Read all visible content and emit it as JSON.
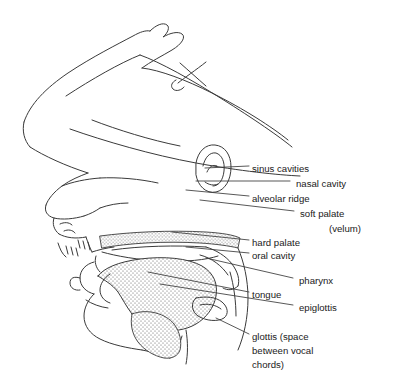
{
  "figure": {
    "kind": "anatomical-line-drawing",
    "background_color": "#ffffff",
    "ink_color": "#3a3a3a",
    "text_color": "#1a1a1a",
    "stipple_color": "#555555",
    "width": 396,
    "height": 386
  },
  "labels": [
    {
      "id": "sinus-cavities",
      "text": "sinus cavities",
      "x": 252,
      "y": 169
    },
    {
      "id": "nasal-cavity",
      "text": "nasal cavity",
      "x": 296,
      "y": 184
    },
    {
      "id": "alveolar-ridge",
      "text": "alveolar ridge",
      "x": 252,
      "y": 199
    },
    {
      "id": "soft-palate",
      "text": "soft palate",
      "x": 300,
      "y": 214
    },
    {
      "id": "velum",
      "text": "(velum)",
      "x": 329,
      "y": 229
    },
    {
      "id": "hard-palate",
      "text": "hard palate",
      "x": 252,
      "y": 243
    },
    {
      "id": "oral-cavity",
      "text": "oral cavity",
      "x": 252,
      "y": 256
    },
    {
      "id": "pharynx",
      "text": "pharynx",
      "x": 299,
      "y": 281
    },
    {
      "id": "tongue",
      "text": "tongue",
      "x": 252,
      "y": 295
    },
    {
      "id": "epiglottis",
      "text": "epiglottis",
      "x": 299,
      "y": 308
    },
    {
      "id": "glottis",
      "text": "glottis (space",
      "x": 252,
      "y": 337
    },
    {
      "id": "glottis-line-2",
      "text": "between vocal",
      "x": 252,
      "y": 351
    },
    {
      "id": "glottis-line-3",
      "text": "chords)",
      "x": 252,
      "y": 365
    }
  ],
  "leader_lines": [
    {
      "id": "leader-sinus-cavities",
      "label": "sinus cavities"
    },
    {
      "id": "leader-nasal-cavity",
      "label": "nasal cavity"
    },
    {
      "id": "leader-alveolar-ridge",
      "label": "alveolar ridge"
    },
    {
      "id": "leader-soft-palate",
      "label": "soft palate"
    },
    {
      "id": "leader-hard-palate",
      "label": "hard palate"
    },
    {
      "id": "leader-oral-cavity",
      "label": "oral cavity"
    },
    {
      "id": "leader-pharynx",
      "label": "pharynx"
    },
    {
      "id": "leader-tongue",
      "label": "tongue"
    },
    {
      "id": "leader-epiglottis",
      "label": "epiglottis"
    },
    {
      "id": "leader-glottis",
      "label": "glottis"
    }
  ],
  "structures": [
    {
      "id": "skull-cranium",
      "name": "cranium outline"
    },
    {
      "id": "scalp-hair",
      "name": "hair / scalp contour"
    },
    {
      "id": "ear",
      "name": "outer ear"
    },
    {
      "id": "nose",
      "name": "nose profile"
    },
    {
      "id": "hard-palate-mass",
      "name": "hard palate (stippled)"
    },
    {
      "id": "tongue-mass",
      "name": "tongue (stippled)"
    },
    {
      "id": "lower-jaw",
      "name": "mandible / lower jaw"
    },
    {
      "id": "teeth",
      "name": "teeth"
    },
    {
      "id": "epiglottis-flap",
      "name": "epiglottis"
    },
    {
      "id": "pharynx-wall",
      "name": "pharyngeal wall"
    }
  ]
}
